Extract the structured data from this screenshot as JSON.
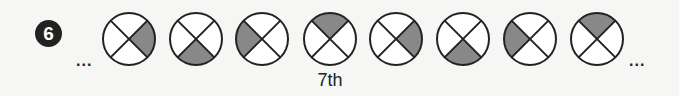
{
  "problem": {
    "number": "6",
    "leading_ellipsis": "...",
    "trailing_ellipsis": "...",
    "label": "7th",
    "label_under_index": 3
  },
  "colors": {
    "shade": "#888888",
    "stroke": "#222222",
    "fill": "#ffffff",
    "badge_bg": "#222222"
  },
  "sequence": [
    {
      "index": 1,
      "shaded_quadrant": "right",
      "center_x": 129
    },
    {
      "index": 2,
      "shaded_quadrant": "bottom",
      "center_x": 196
    },
    {
      "index": 3,
      "shaded_quadrant": "left",
      "center_x": 262
    },
    {
      "index": 4,
      "shaded_quadrant": "top",
      "center_x": 330
    },
    {
      "index": 5,
      "shaded_quadrant": "right",
      "center_x": 396
    },
    {
      "index": 6,
      "shaded_quadrant": "bottom",
      "center_x": 463
    },
    {
      "index": 7,
      "shaded_quadrant": "left",
      "center_x": 530
    },
    {
      "index": 8,
      "shaded_quadrant": "top",
      "center_x": 597
    }
  ]
}
